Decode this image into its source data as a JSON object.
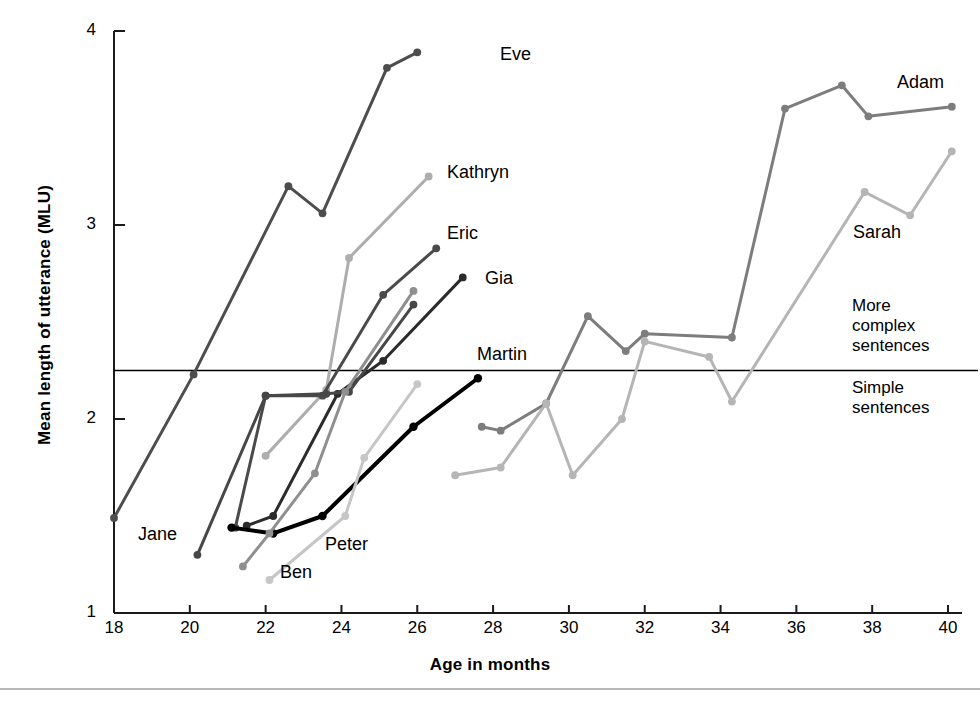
{
  "chart_data": {
    "type": "line",
    "title": "",
    "xlabel": "Age in months",
    "ylabel": "Mean length of utterance (MLU)",
    "xlim": [
      18,
      40
    ],
    "ylim": [
      1,
      4
    ],
    "xticks": [
      18,
      20,
      22,
      24,
      26,
      28,
      30,
      32,
      34,
      36,
      38,
      40
    ],
    "yticks": [
      1,
      2,
      3,
      4
    ],
    "grid": false,
    "legend_position": "inline-end-of-line",
    "reference_line": {
      "value": 2.25,
      "above_label": "More\ncomplex\nsentences",
      "below_label": "Simple\nsentences"
    },
    "series": [
      {
        "name": "Eve",
        "color": "#4d4d4d",
        "width": 3,
        "label_x": 500,
        "label_y": 44,
        "x": [
          18.0,
          20.1,
          22.6,
          23.5,
          25.2,
          26.0
        ],
        "y": [
          1.49,
          2.23,
          3.2,
          3.06,
          3.81,
          3.89
        ]
      },
      {
        "name": "Kathryn",
        "color": "#adadad",
        "width": 3,
        "label_x": 447,
        "label_y": 162,
        "x": [
          22.0,
          23.6,
          24.2,
          26.3
        ],
        "y": [
          1.81,
          2.15,
          2.83,
          3.25
        ]
      },
      {
        "name": "Eric",
        "color": "#4a4a4a",
        "width": 3,
        "label_x": 447,
        "label_y": 223,
        "x": [
          21.2,
          22.0,
          23.5,
          25.1,
          26.5
        ],
        "y": [
          1.44,
          2.12,
          2.12,
          2.64,
          2.88
        ]
      },
      {
        "name": "Gia",
        "color": "#2b2b2b",
        "width": 3,
        "label_x": 485,
        "label_y": 268,
        "x": [
          21.5,
          22.2,
          23.9,
          25.1,
          27.2
        ],
        "y": [
          1.45,
          1.5,
          2.13,
          2.3,
          2.73
        ]
      },
      {
        "name": "Martin",
        "color": "#000000",
        "width": 4,
        "label_x": 477,
        "label_y": 344,
        "x": [
          21.1,
          22.2,
          23.5,
          25.9,
          27.6
        ],
        "y": [
          1.44,
          1.41,
          1.5,
          1.96,
          2.21
        ]
      },
      {
        "name": "Jane",
        "color": "#474747",
        "width": 3,
        "label_x": 138,
        "label_y": 524,
        "x": [
          20.2,
          22.0,
          23.6,
          24.2,
          25.9
        ],
        "y": [
          1.3,
          2.12,
          2.13,
          2.14,
          2.59
        ]
      },
      {
        "name": "Ben",
        "color": "#8f8f8f",
        "width": 3,
        "label_x": 280,
        "label_y": 562,
        "x": [
          21.4,
          22.1,
          23.3,
          24.1,
          25.9
        ],
        "y": [
          1.24,
          1.41,
          1.72,
          2.14,
          2.66
        ]
      },
      {
        "name": "Peter",
        "color": "#c6c6c6",
        "width": 3,
        "label_x": 325,
        "label_y": 534,
        "x": [
          22.1,
          24.1,
          24.6,
          26.0
        ],
        "y": [
          1.17,
          1.5,
          1.8,
          2.18
        ]
      },
      {
        "name": "Adam",
        "color": "#7d7d7d",
        "width": 3,
        "label_x": 897,
        "label_y": 72,
        "x": [
          27.7,
          28.2,
          29.4,
          30.5,
          31.5,
          32.0,
          34.3,
          35.7,
          37.2,
          37.9,
          40.1
        ],
        "y": [
          1.96,
          1.94,
          2.08,
          2.53,
          2.35,
          2.44,
          2.42,
          3.6,
          3.72,
          3.56,
          3.61
        ]
      },
      {
        "name": "Sarah",
        "color": "#b5b5b5",
        "width": 3,
        "label_x": 853,
        "label_y": 222,
        "x": [
          27.0,
          28.2,
          29.4,
          30.1,
          31.4,
          32.0,
          33.7,
          34.3,
          37.8,
          39.0,
          40.1
        ],
        "y": [
          1.71,
          1.75,
          2.08,
          1.71,
          2.0,
          2.4,
          2.32,
          2.09,
          3.17,
          3.05,
          3.38
        ]
      }
    ]
  }
}
